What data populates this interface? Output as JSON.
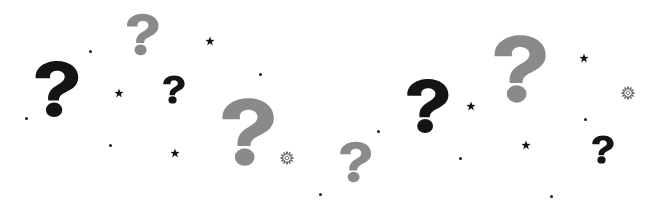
{
  "colors": {
    "dark": "#141414",
    "gray": "#8a8a8a",
    "background": "#ffffff"
  },
  "question_marks": [
    {
      "id": "qm-gray-top-left",
      "x": 124,
      "y": 13,
      "w": 36,
      "h": 43,
      "color": "gray"
    },
    {
      "id": "qm-black-left",
      "x": 31,
      "y": 60,
      "w": 50,
      "h": 58,
      "color": "dark"
    },
    {
      "id": "qm-black-small",
      "x": 161,
      "y": 75,
      "w": 25,
      "h": 29,
      "color": "dark"
    },
    {
      "id": "qm-gray-large",
      "x": 216,
      "y": 97,
      "w": 62,
      "h": 70,
      "color": "gray"
    },
    {
      "id": "qm-gray-bottom",
      "x": 336,
      "y": 141,
      "w": 38,
      "h": 42,
      "color": "gray"
    },
    {
      "id": "qm-black-center",
      "x": 403,
      "y": 78,
      "w": 48,
      "h": 56,
      "color": "dark"
    },
    {
      "id": "qm-gray-top-right",
      "x": 490,
      "y": 34,
      "w": 58,
      "h": 70,
      "color": "gray"
    },
    {
      "id": "qm-black-right",
      "x": 590,
      "y": 135,
      "w": 25,
      "h": 29,
      "color": "dark"
    }
  ],
  "stars": [
    {
      "x": 210,
      "y": 41
    },
    {
      "x": 119,
      "y": 93
    },
    {
      "x": 175,
      "y": 153
    },
    {
      "x": 471,
      "y": 106
    },
    {
      "x": 584,
      "y": 58
    },
    {
      "x": 526,
      "y": 145
    }
  ],
  "bursts": [
    {
      "x": 287,
      "y": 158
    },
    {
      "x": 628,
      "y": 93
    }
  ],
  "dots": [
    {
      "x": 90,
      "y": 51
    },
    {
      "x": 26,
      "y": 118
    },
    {
      "x": 110,
      "y": 145
    },
    {
      "x": 260,
      "y": 74
    },
    {
      "x": 320,
      "y": 194
    },
    {
      "x": 378,
      "y": 131
    },
    {
      "x": 460,
      "y": 158
    },
    {
      "x": 585,
      "y": 119
    },
    {
      "x": 551,
      "y": 196
    }
  ]
}
